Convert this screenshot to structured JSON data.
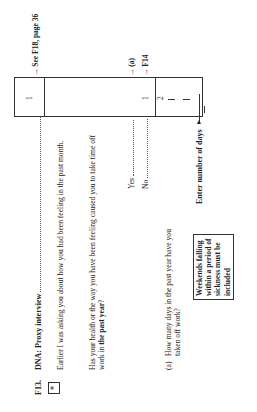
{
  "question": {
    "number": "F13.",
    "marker": "*",
    "title": "DNA: Proxy interview",
    "intro": "Earlier I was asking you about how you had been feeling in the past month.",
    "main_question_pre": "Has your health or the way you have been feeling caused you to take time off work in ",
    "main_question_bold": "the past year",
    "main_question_post": "?",
    "options": [
      {
        "label": "Yes",
        "code": "1",
        "route": "(a)"
      },
      {
        "label": "No",
        "code": "2",
        "route": "F14"
      }
    ],
    "dna_code": "1",
    "dna_route": "See F18, page 36",
    "sub_question_label": "(a)",
    "sub_question": "How many days in the past year have you taken off work?",
    "instruction": "Enter number of days",
    "note": "Weekends falling within a period of sickness must be included"
  }
}
